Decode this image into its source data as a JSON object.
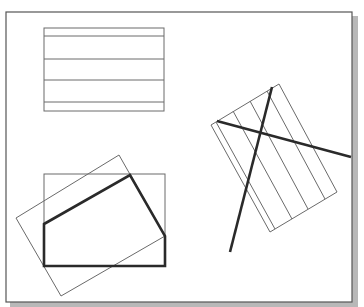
{
  "colors": {
    "background": "#ffffff",
    "frame": "#555555",
    "frame_shadow": "#b8b8b8",
    "thin_line": "#6a6a6a",
    "thick_line": "#2a2a2a"
  },
  "frame": {
    "x": 6,
    "y": 12,
    "width": 346,
    "height": 290
  },
  "figures": {
    "hatched_rectangle": {
      "rect": {
        "x": 44,
        "y": 28,
        "width": 120,
        "height": 83
      },
      "hatch_lines_y": [
        36,
        59,
        80,
        102
      ]
    },
    "clipped_polygon_group": {
      "clip_rect": {
        "x": 44,
        "y": 174,
        "width": 121,
        "height": 92
      },
      "rotated_rect": [
        [
          119,
          155
        ],
        [
          165,
          236
        ],
        [
          61,
          296
        ],
        [
          16,
          218
        ]
      ],
      "polygon": [
        [
          44,
          224
        ],
        [
          130,
          175
        ],
        [
          165,
          236
        ],
        [
          165,
          266
        ],
        [
          44,
          266
        ]
      ]
    },
    "rotated_hatch_group": {
      "rotated_rect": [
        [
          279,
          84
        ],
        [
          337,
          192
        ],
        [
          270,
          232
        ],
        [
          211,
          125
        ]
      ],
      "hatch_lines": [
        [
          [
            216,
            122
          ],
          [
            275,
            229
          ]
        ],
        [
          [
            233,
            111
          ],
          [
            292,
            219
          ]
        ],
        [
          [
            250,
            101
          ],
          [
            308,
            209
          ]
        ],
        [
          [
            267,
            91
          ],
          [
            325,
            199
          ]
        ]
      ],
      "thick_lines": [
        [
          [
            217,
            121
          ],
          [
            351,
            157
          ]
        ],
        [
          [
            272,
            87
          ],
          [
            230,
            252
          ]
        ]
      ]
    }
  }
}
